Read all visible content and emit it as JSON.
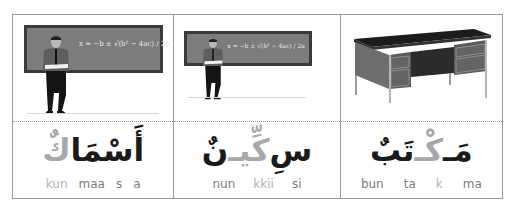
{
  "cards": [
    {
      "image": "teacher-at-chalkboard-icon",
      "formula": "x = −b ± √(b² − 4ac) / 2a",
      "word_parts": [
        {
          "text": "أَسْمَا",
          "highlight": false
        },
        {
          "text": "كٌ",
          "highlight": true
        }
      ],
      "syllables": [
        {
          "text": "kun",
          "highlight": true
        },
        {
          "text": "maa",
          "highlight": false
        },
        {
          "text": "s",
          "highlight": false
        },
        {
          "text": "a",
          "highlight": false
        }
      ]
    },
    {
      "image": "teacher-at-chalkboard-icon",
      "formula": "x = −b ± √(b² − 4ac) / 2a",
      "word_parts": [
        {
          "text": "سِ",
          "highlight": false
        },
        {
          "text": "كِّيـ",
          "highlight": true
        },
        {
          "text": "نٌ",
          "highlight": false
        }
      ],
      "syllables": [
        {
          "text": "nun",
          "highlight": false
        },
        {
          "text": "kkii",
          "highlight": true
        },
        {
          "text": "si",
          "highlight": false
        }
      ]
    },
    {
      "image": "office-desk-icon",
      "word_parts": [
        {
          "text": "مَـ",
          "highlight": false
        },
        {
          "text": "كْـ",
          "highlight": true
        },
        {
          "text": "تَبٌ",
          "highlight": false
        }
      ],
      "syllables": [
        {
          "text": "bun",
          "highlight": false
        },
        {
          "text": "ta",
          "highlight": false
        },
        {
          "text": "k",
          "highlight": true
        },
        {
          "text": "ma",
          "highlight": false
        }
      ]
    }
  ],
  "colors": {
    "text": "#1a1a1a",
    "highlight": "#a8a8a8",
    "translit": "#7d7d7d",
    "border": "#9a9a9a"
  }
}
